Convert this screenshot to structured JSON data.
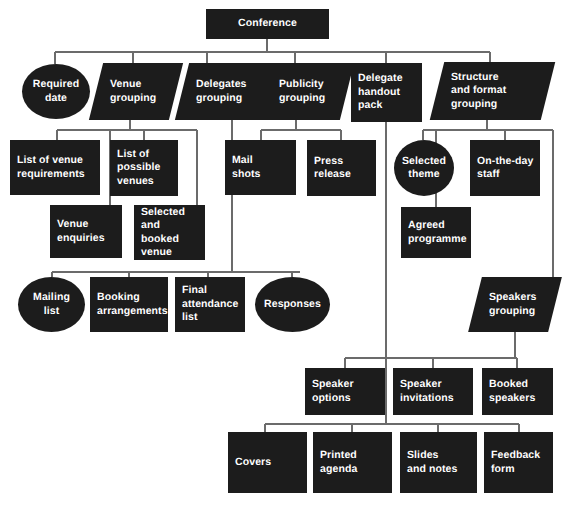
{
  "diagram": {
    "root": {
      "label": "Conference",
      "shape": "rect"
    },
    "level1": [
      {
        "label": "Required\ndate",
        "shape": "ellipse"
      },
      {
        "label": "Venue\ngrouping",
        "shape": "parallelogram"
      },
      {
        "label": "Delegates\ngrouping",
        "shape": "parallelogram"
      },
      {
        "label": "Publicity\ngrouping",
        "shape": "parallelogram"
      },
      {
        "label": "Delegate\nhandout\npack",
        "shape": "rect"
      },
      {
        "label": "Structure\nand format\ngrouping",
        "shape": "parallelogram"
      }
    ],
    "venue_children": [
      {
        "label": "List of venue\nrequirements",
        "shape": "rect"
      },
      {
        "label": "List of\npossible\nvenues",
        "shape": "rect"
      },
      {
        "label": "Venue\nenquiries",
        "shape": "rect"
      },
      {
        "label": "Selected and\nbooked\nvenue",
        "shape": "rect"
      }
    ],
    "publicity_children": [
      {
        "label": "Mail\nshots",
        "shape": "rect"
      },
      {
        "label": "Press\nrelease",
        "shape": "rect"
      }
    ],
    "structure_children": [
      {
        "label": "Selected\ntheme",
        "shape": "ellipse"
      },
      {
        "label": "On-the-day\nstaff",
        "shape": "rect"
      },
      {
        "label": "Agreed\nprogramme",
        "shape": "rect"
      }
    ],
    "delegates_children": [
      {
        "label": "Mailing\nlist",
        "shape": "ellipse"
      },
      {
        "label": "Booking\narrangements",
        "shape": "rect"
      },
      {
        "label": "Final\nattendance\nlist",
        "shape": "rect"
      },
      {
        "label": "Responses",
        "shape": "ellipse"
      }
    ],
    "speakers_group": {
      "label": "Speakers\ngrouping",
      "shape": "parallelogram"
    },
    "speakers_children": [
      {
        "label": "Speaker\noptions",
        "shape": "rect"
      },
      {
        "label": "Speaker\ninvitations",
        "shape": "rect"
      },
      {
        "label": "Booked\nspeakers",
        "shape": "rect"
      }
    ],
    "handout_children": [
      {
        "label": "Covers",
        "shape": "rect"
      },
      {
        "label": "Printed\nagenda",
        "shape": "rect"
      },
      {
        "label": "Slides\nand notes",
        "shape": "rect"
      },
      {
        "label": "Feedback\nform",
        "shape": "rect"
      }
    ],
    "colors": {
      "node_fill": "#1c1c1c",
      "node_text": "#ffffff",
      "connector": "#6b6b6b",
      "background": "#ffffff"
    }
  }
}
